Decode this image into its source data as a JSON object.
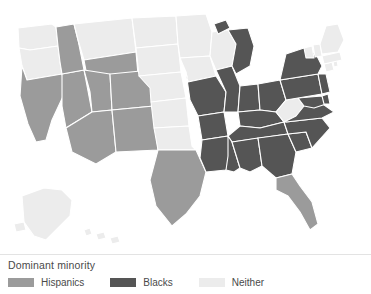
{
  "legend": {
    "title": "Dominant minority",
    "items": [
      {
        "label": "Hispanics",
        "color": "#9b9b9b",
        "key": "hispanics"
      },
      {
        "label": "Blacks",
        "color": "#555555",
        "key": "blacks"
      },
      {
        "label": "Neither",
        "color": "#ececec",
        "key": "neither"
      }
    ]
  },
  "map": {
    "background": "#ffffff",
    "border_color": "#ffffff",
    "categories": {
      "hispanics": "#9b9b9b",
      "blacks": "#555555",
      "neither": "#ececec"
    },
    "states": [
      {
        "code": "WA",
        "name": "Washington",
        "category": "neither"
      },
      {
        "code": "OR",
        "name": "Oregon",
        "category": "neither"
      },
      {
        "code": "ID",
        "name": "Idaho",
        "category": "hispanics"
      },
      {
        "code": "MT",
        "name": "Montana",
        "category": "neither"
      },
      {
        "code": "WY",
        "name": "Wyoming",
        "category": "hispanics"
      },
      {
        "code": "CA",
        "name": "California",
        "category": "hispanics"
      },
      {
        "code": "NV",
        "name": "Nevada",
        "category": "hispanics"
      },
      {
        "code": "UT",
        "name": "Utah",
        "category": "hispanics"
      },
      {
        "code": "CO",
        "name": "Colorado",
        "category": "hispanics"
      },
      {
        "code": "AZ",
        "name": "Arizona",
        "category": "hispanics"
      },
      {
        "code": "NM",
        "name": "New Mexico",
        "category": "hispanics"
      },
      {
        "code": "ND",
        "name": "North Dakota",
        "category": "neither"
      },
      {
        "code": "SD",
        "name": "South Dakota",
        "category": "neither"
      },
      {
        "code": "NE",
        "name": "Nebraska",
        "category": "neither"
      },
      {
        "code": "KS",
        "name": "Kansas",
        "category": "neither"
      },
      {
        "code": "OK",
        "name": "Oklahoma",
        "category": "neither"
      },
      {
        "code": "TX",
        "name": "Texas",
        "category": "hispanics"
      },
      {
        "code": "MN",
        "name": "Minnesota",
        "category": "neither"
      },
      {
        "code": "IA",
        "name": "Iowa",
        "category": "neither"
      },
      {
        "code": "MO",
        "name": "Missouri",
        "category": "blacks"
      },
      {
        "code": "AR",
        "name": "Arkansas",
        "category": "blacks"
      },
      {
        "code": "LA",
        "name": "Louisiana",
        "category": "blacks"
      },
      {
        "code": "WI",
        "name": "Wisconsin",
        "category": "neither"
      },
      {
        "code": "IL",
        "name": "Illinois",
        "category": "blacks"
      },
      {
        "code": "MI",
        "name": "Michigan",
        "category": "blacks"
      },
      {
        "code": "IN",
        "name": "Indiana",
        "category": "blacks"
      },
      {
        "code": "OH",
        "name": "Ohio",
        "category": "blacks"
      },
      {
        "code": "KY",
        "name": "Kentucky",
        "category": "blacks"
      },
      {
        "code": "TN",
        "name": "Tennessee",
        "category": "blacks"
      },
      {
        "code": "MS",
        "name": "Mississippi",
        "category": "blacks"
      },
      {
        "code": "AL",
        "name": "Alabama",
        "category": "blacks"
      },
      {
        "code": "GA",
        "name": "Georgia",
        "category": "blacks"
      },
      {
        "code": "FL",
        "name": "Florida",
        "category": "hispanics"
      },
      {
        "code": "SC",
        "name": "South Carolina",
        "category": "blacks"
      },
      {
        "code": "NC",
        "name": "North Carolina",
        "category": "blacks"
      },
      {
        "code": "VA",
        "name": "Virginia",
        "category": "blacks"
      },
      {
        "code": "WV",
        "name": "West Virginia",
        "category": "neither"
      },
      {
        "code": "MD",
        "name": "Maryland",
        "category": "blacks"
      },
      {
        "code": "DE",
        "name": "Delaware",
        "category": "blacks"
      },
      {
        "code": "PA",
        "name": "Pennsylvania",
        "category": "blacks"
      },
      {
        "code": "NJ",
        "name": "New Jersey",
        "category": "blacks"
      },
      {
        "code": "NY",
        "name": "New York",
        "category": "blacks"
      },
      {
        "code": "CT",
        "name": "Connecticut",
        "category": "neither"
      },
      {
        "code": "RI",
        "name": "Rhode Island",
        "category": "neither"
      },
      {
        "code": "MA",
        "name": "Massachusetts",
        "category": "neither"
      },
      {
        "code": "VT",
        "name": "Vermont",
        "category": "neither"
      },
      {
        "code": "NH",
        "name": "New Hampshire",
        "category": "neither"
      },
      {
        "code": "ME",
        "name": "Maine",
        "category": "neither"
      },
      {
        "code": "AK",
        "name": "Alaska",
        "category": "neither"
      },
      {
        "code": "HI",
        "name": "Hawaii",
        "category": "neither"
      }
    ]
  }
}
